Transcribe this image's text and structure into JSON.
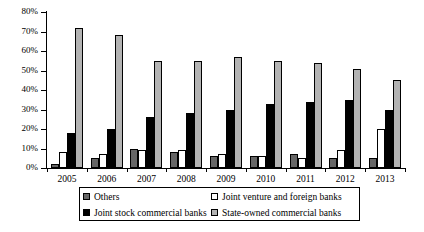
{
  "chart_data": {
    "type": "bar",
    "title": "",
    "xlabel": "",
    "ylabel": "",
    "ylim": [
      0,
      80
    ],
    "ytick_labels": [
      "0%",
      "10%",
      "20%",
      "30%",
      "40%",
      "50%",
      "60%",
      "70%",
      "80%"
    ],
    "ytick_values": [
      0,
      10,
      20,
      30,
      40,
      50,
      60,
      70,
      80
    ],
    "grid": false,
    "legend_position": "bottom",
    "categories": [
      "2005",
      "2006",
      "2007",
      "2008",
      "2009",
      "2010",
      "2011",
      "2012",
      "2013"
    ],
    "series": [
      {
        "name": "Others",
        "color": "#666666",
        "values": [
          2,
          5,
          10,
          8,
          6,
          6,
          7,
          5,
          5
        ]
      },
      {
        "name": "Joint venture and foreign banks",
        "color": "#ffffff",
        "values": [
          8,
          7,
          9,
          9,
          7,
          6,
          5,
          9,
          20
        ]
      },
      {
        "name": "Joint stock commercial banks",
        "color": "#000000",
        "values": [
          18,
          20,
          26,
          28,
          30,
          33,
          34,
          35,
          30
        ]
      },
      {
        "name": "State-owned commercial banks",
        "color": "#b3b3b3",
        "values": [
          72,
          68,
          55,
          55,
          57,
          55,
          54,
          51,
          45
        ]
      }
    ]
  },
  "legend": {
    "items": [
      {
        "label": "Others",
        "color": "#666666"
      },
      {
        "label": "Joint venture and foreign banks",
        "color": "#ffffff"
      },
      {
        "label": "Joint stock commercial banks",
        "color": "#000000"
      },
      {
        "label": "State-owned commercial banks",
        "color": "#b3b3b3"
      }
    ]
  }
}
